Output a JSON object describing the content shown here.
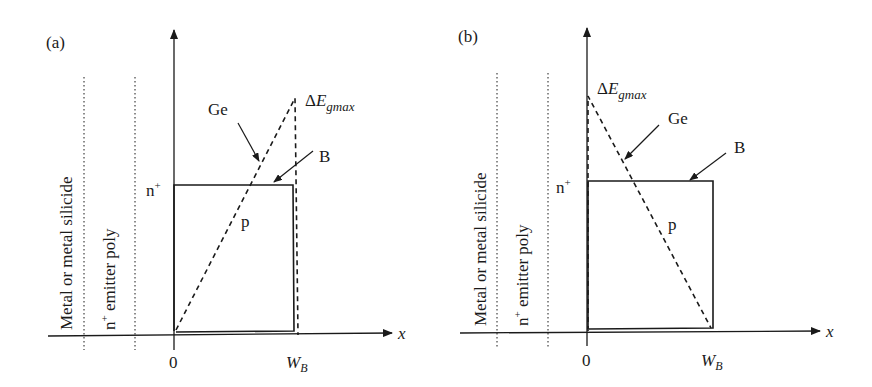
{
  "figure": {
    "panels": [
      {
        "id": "a",
        "panel_label": "(a)",
        "region_labels": {
          "metal": "Metal or metal silicide",
          "emitter_prefix": "n",
          "emitter_sup": "+",
          "emitter_suffix": " emitter poly"
        },
        "emitter_doping": {
          "base": "n",
          "sup": "+"
        },
        "base_doping": "p",
        "ge_label": "Ge",
        "boron_label": "B",
        "delta_eg": {
          "delta": "Δ",
          "E": "E",
          "sub": "gmax"
        },
        "x_axis_label": "x",
        "x_ticks": {
          "origin": "0",
          "wb_main": "W",
          "wb_sub": "B"
        },
        "ge_profile": "linearly increasing from 0 at x=0 to ΔEgmax at x=W_B"
      },
      {
        "id": "b",
        "panel_label": "(b)",
        "region_labels": {
          "metal": "Metal or metal silicide",
          "emitter_prefix": "n",
          "emitter_sup": "+",
          "emitter_suffix": " emitter poly"
        },
        "emitter_doping": {
          "base": "n",
          "sup": "+"
        },
        "base_doping": "p",
        "ge_label": "Ge",
        "boron_label": "B",
        "delta_eg": {
          "delta": "Δ",
          "E": "E",
          "sub": "gmax"
        },
        "x_axis_label": "x",
        "x_ticks": {
          "origin": "0",
          "wb_main": "W",
          "wb_sub": "B"
        },
        "ge_profile": "linearly decreasing from ΔEgmax at x=0 to 0 at x=W_B"
      }
    ],
    "colors": {
      "ink": "#1a1a1a",
      "background": "#ffffff"
    }
  }
}
